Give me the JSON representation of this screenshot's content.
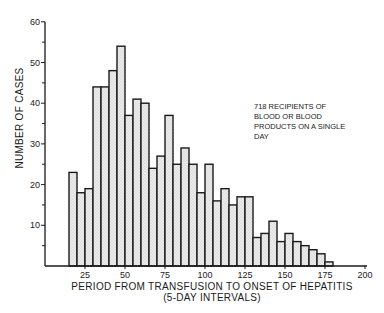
{
  "chart_data": {
    "type": "bar",
    "title": "",
    "xlabel": "PERIOD FROM TRANSFUSION TO ONSET OF HEPATITIS",
    "xlabel_sub": "(5-DAY INTERVALS)",
    "ylabel": "NUMBER OF CASES",
    "xlim": [
      0,
      200
    ],
    "ylim": [
      0,
      60
    ],
    "x_ticks": [
      25,
      50,
      75,
      100,
      125,
      150,
      175,
      200
    ],
    "y_ticks": [
      10,
      20,
      30,
      40,
      50,
      60
    ],
    "grid": false,
    "bin_width": 5,
    "categories": [
      15,
      20,
      25,
      30,
      35,
      40,
      45,
      50,
      55,
      60,
      65,
      70,
      75,
      80,
      85,
      90,
      95,
      100,
      105,
      110,
      115,
      120,
      125,
      130,
      135,
      140,
      145,
      150,
      155,
      160,
      165,
      170,
      175
    ],
    "values": [
      23,
      18,
      19,
      44,
      44,
      48,
      54,
      37,
      41,
      40,
      24,
      27,
      37,
      25,
      29,
      25,
      18,
      25,
      16,
      19,
      15,
      17,
      17,
      7,
      8,
      11,
      6,
      8,
      6,
      5,
      4,
      3,
      1
    ],
    "annotation": [
      "718 RECIPIENTS OF",
      "BLOOD OR BLOOD",
      "PRODUCTS ON A SINGLE",
      "DAY"
    ],
    "bar_fill": "#e4e4e4",
    "bar_stroke": "#1a1a1a"
  }
}
